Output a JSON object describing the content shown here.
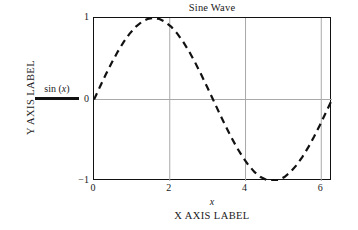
{
  "figure": {
    "background_color": "#ffffff",
    "frame_color": "#111111",
    "grid_color": "#a9a9a9",
    "curve_color": "#111111"
  },
  "title": "Sine Wave",
  "axes": {
    "x_variable": "x",
    "x_axis_label": "X AXIS LABEL",
    "y_axis_label": "Y AXIS LABEL",
    "x_ticks": [
      "0",
      "2",
      "4",
      "6"
    ],
    "y_ticks": [
      "1",
      "0",
      "−1"
    ]
  },
  "legend": {
    "label_prefix": "sin (",
    "label_variable": "x",
    "label_suffix": ")",
    "sample_style": "solid-line"
  },
  "chart_data": {
    "type": "line",
    "title": "Sine Wave",
    "xlabel": "X AXIS LABEL",
    "ylabel": "Y AXIS LABEL",
    "x_variable": "x",
    "xlim": [
      0,
      6.283185
    ],
    "ylim": [
      -1,
      1
    ],
    "xticks": [
      0,
      2,
      4,
      6
    ],
    "yticks": [
      -1,
      0,
      1
    ],
    "grid": true,
    "grid_lines": {
      "vertical_at": [
        2,
        4,
        6
      ],
      "horizontal_at": [
        0
      ]
    },
    "legend": {
      "position": "outside-left",
      "entries": [
        {
          "name": "sin (x)",
          "style": "dashed",
          "color": "#111111"
        }
      ]
    },
    "series": [
      {
        "name": "sin (x)",
        "style": "dashed",
        "color": "#111111",
        "linewidth": 2,
        "x": [
          0,
          0.157,
          0.314,
          0.471,
          0.628,
          0.785,
          0.942,
          1.1,
          1.257,
          1.414,
          1.571,
          1.728,
          1.885,
          2.042,
          2.199,
          2.356,
          2.513,
          2.67,
          2.827,
          2.985,
          3.142,
          3.299,
          3.456,
          3.613,
          3.77,
          3.927,
          4.084,
          4.241,
          4.398,
          4.555,
          4.712,
          4.869,
          5.027,
          5.184,
          5.341,
          5.498,
          5.655,
          5.812,
          5.969,
          6.126,
          6.283
        ],
        "y": [
          0,
          0.156,
          0.309,
          0.454,
          0.588,
          0.707,
          0.809,
          0.891,
          0.951,
          0.988,
          1,
          0.988,
          0.951,
          0.891,
          0.809,
          0.707,
          0.588,
          0.454,
          0.309,
          0.156,
          0,
          -0.156,
          -0.309,
          -0.454,
          -0.588,
          -0.707,
          -0.809,
          -0.891,
          -0.951,
          -0.988,
          -1,
          -0.988,
          -0.951,
          -0.891,
          -0.809,
          -0.707,
          -0.588,
          -0.454,
          -0.309,
          -0.156,
          0
        ],
        "peak": {
          "x": 1.571,
          "y": 1
        },
        "trough": {
          "x": 4.712,
          "y": -1
        },
        "zero_crossings": [
          0,
          3.142,
          6.283
        ]
      }
    ]
  }
}
